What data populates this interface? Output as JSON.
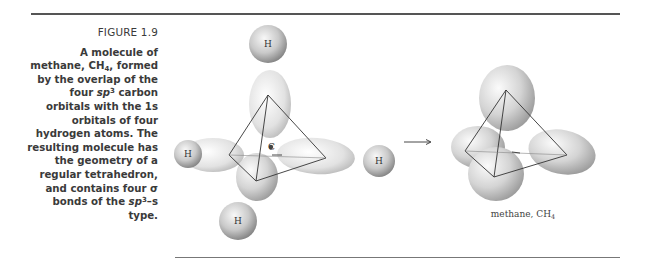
{
  "figure": {
    "label": "FIGURE 1.9",
    "caption_lines": [
      "A molecule of",
      "methane, CH₄, formed",
      "by the overlap of the",
      "four sp³ carbon",
      "orbitals with the 1s",
      "orbitals of four",
      "hydrogen atoms. The",
      "resulting molecule has",
      "the geometry of a",
      "regular tetrahedron,",
      "and contains four σ",
      "bonds of the sp³–s",
      "type."
    ],
    "caption": {
      "l1": "A molecule of",
      "l2a": "methane, CH",
      "l2sub": "4",
      "l2b": ", formed",
      "l3": "by the overlap of the",
      "l4a": "four ",
      "l4it": "sp",
      "l4sup": "3",
      "l4b": " carbon",
      "l5": "orbitals with the 1s",
      "l6": "orbitals of four",
      "l7": "hydrogen atoms. The",
      "l8": "resulting molecule has",
      "l9": "the geometry of a",
      "l10": "regular tetrahedron,",
      "l11": "and contains four σ",
      "l12a": "bonds of the ",
      "l12it": "sp",
      "l12sup": "3",
      "l12b": "–s",
      "l13": "type."
    }
  },
  "diagram": {
    "left": {
      "hydrogen_atoms": [
        {
          "label": "H",
          "cx": 268,
          "cy": 44,
          "r": 19
        },
        {
          "label": "H",
          "cx": 188,
          "cy": 154,
          "r": 14
        },
        {
          "label": "H",
          "cx": 379,
          "cy": 161,
          "r": 16
        },
        {
          "label": "H",
          "cx": 238,
          "cy": 221,
          "r": 19
        }
      ],
      "carbon_label": "C"
    },
    "arrow": {
      "from_x": 404,
      "to_x": 432,
      "y": 142
    },
    "right": {
      "name": "methane, CH",
      "name_sub": "4"
    }
  },
  "colors": {
    "rule": "#555555",
    "caption_text": "#3a3a3a",
    "orbital_light": "#f4f4f4",
    "orbital_dark": "#9a9a9a",
    "tetra_line": "#333333"
  }
}
